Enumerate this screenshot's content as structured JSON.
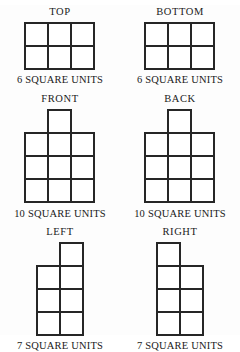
{
  "figure": {
    "cell_size_px": 23,
    "stroke_color": "#262626",
    "fill_color": "#ffffff",
    "background_color": "#fdfdfd",
    "area_unit_text": "SQUARE UNITS"
  },
  "views": [
    {
      "id": "top",
      "title": "TOP",
      "area_text": "6 SQUARE UNITS",
      "area_value": 6,
      "grid_cols": 3,
      "grid_rows": 2,
      "cells": [
        [
          1,
          1,
          1
        ],
        [
          1,
          1,
          1
        ]
      ]
    },
    {
      "id": "bottom",
      "title": "BOTTOM",
      "area_text": "6 SQUARE UNITS",
      "area_value": 6,
      "grid_cols": 3,
      "grid_rows": 2,
      "cells": [
        [
          1,
          1,
          1
        ],
        [
          1,
          1,
          1
        ]
      ]
    },
    {
      "id": "front",
      "title": "FRONT",
      "area_text": "10 SQUARE UNITS",
      "area_value": 10,
      "grid_cols": 3,
      "grid_rows": 4,
      "cells": [
        [
          0,
          1,
          0
        ],
        [
          1,
          1,
          1
        ],
        [
          1,
          1,
          1
        ],
        [
          1,
          1,
          1
        ]
      ]
    },
    {
      "id": "back",
      "title": "BACK",
      "area_text": "10 SQUARE UNITS",
      "area_value": 10,
      "grid_cols": 3,
      "grid_rows": 4,
      "cells": [
        [
          0,
          1,
          0
        ],
        [
          1,
          1,
          1
        ],
        [
          1,
          1,
          1
        ],
        [
          1,
          1,
          1
        ]
      ]
    },
    {
      "id": "left",
      "title": "LEFT",
      "area_text": "7 SQUARE UNITS",
      "area_value": 7,
      "grid_cols": 2,
      "grid_rows": 4,
      "cells": [
        [
          0,
          1
        ],
        [
          1,
          1
        ],
        [
          1,
          1
        ],
        [
          1,
          1
        ]
      ]
    },
    {
      "id": "right",
      "title": "RIGHT",
      "area_text": "7 SQUARE UNITS",
      "area_value": 7,
      "grid_cols": 2,
      "grid_rows": 4,
      "cells": [
        [
          1,
          0
        ],
        [
          1,
          1
        ],
        [
          1,
          1
        ],
        [
          1,
          1
        ]
      ]
    }
  ]
}
